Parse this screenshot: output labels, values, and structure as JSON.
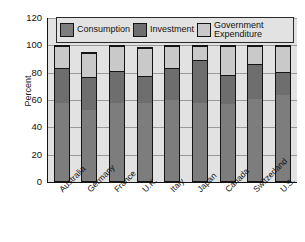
{
  "chart_data": {
    "type": "bar",
    "subtype": "stacked-bar",
    "title": "",
    "xlabel": "",
    "ylabel": "Percent",
    "ylim": [
      0,
      120
    ],
    "yticks": [
      0,
      20,
      40,
      60,
      80,
      100,
      120
    ],
    "grid": true,
    "legend_position": "top-inside",
    "categories": [
      "Australia",
      "Germany",
      "France",
      "U.K.",
      "Italy",
      "Japan",
      "Canada",
      "Switzerland",
      "U.S."
    ],
    "series": [
      {
        "name": "Consumption",
        "color": "#7d7d7d",
        "values": [
          58,
          53,
          58,
          58,
          60,
          58,
          57,
          61,
          64
        ]
      },
      {
        "name": "Investment",
        "color": "#6e6e6e",
        "values": [
          26,
          24,
          24,
          20,
          24,
          32,
          22,
          26,
          17
        ]
      },
      {
        "name": "Government Expenditure",
        "color": "#c9c9c9",
        "values": [
          16,
          18,
          18,
          21,
          16,
          10,
          21,
          13,
          19
        ]
      }
    ],
    "totals": [
      100,
      95,
      100,
      99,
      100,
      100,
      100,
      100,
      100
    ]
  },
  "axis": {
    "y_label": "Percent",
    "y_ticks": [
      "120",
      "100",
      "80",
      "60",
      "40",
      "20",
      "0"
    ]
  },
  "legend": {
    "items": [
      {
        "label": "Consumption",
        "key": "consumption"
      },
      {
        "label": "Investment",
        "key": "investment"
      },
      {
        "label": "Government Expenditure",
        "key": "government"
      }
    ]
  }
}
